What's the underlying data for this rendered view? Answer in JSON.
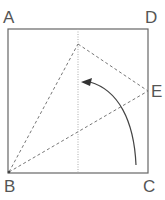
{
  "diagram": {
    "type": "geometry-fold",
    "labels": {
      "A": "A",
      "B": "B",
      "C": "C",
      "D": "D",
      "E": "E"
    },
    "colors": {
      "stroke": "#666666",
      "dashed": "#777777",
      "arrow": "#444444"
    }
  }
}
